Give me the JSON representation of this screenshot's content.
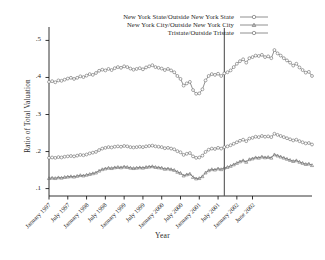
{
  "figure": {
    "background": "#ffffff",
    "ink": "#1d1d1d",
    "marker_color": "#6b6b6b"
  },
  "chart_data": {
    "type": "line",
    "title": "",
    "xlabel": "Year",
    "ylabel": "Ratio of Total Valuation",
    "ylim": [
      0.08,
      0.52
    ],
    "yticks": [
      0.1,
      0.2,
      0.3,
      0.4,
      0.5
    ],
    "ytick_labels": [
      ".1",
      ".2",
      ".3",
      ".4",
      ".5"
    ],
    "grid": false,
    "legend_position": "top-center",
    "xtick_labels": [
      "January 1997",
      "July 1997",
      "January 1998",
      "July 1998",
      "January 1999",
      "July 1999",
      "January 2000",
      "July 2000",
      "January 2001",
      "July 2001",
      "January 2002",
      "June 2002"
    ],
    "xtick_indices": [
      0,
      6,
      12,
      18,
      24,
      30,
      36,
      42,
      48,
      54,
      60,
      65
    ],
    "x_count": 66,
    "annotations": [
      {
        "name": "september-2001-reference-line",
        "x_index": 56,
        "label": ""
      }
    ],
    "series": [
      {
        "name": "New York State/Outside New York State",
        "marker": "circle",
        "values": [
          0.388,
          0.39,
          0.387,
          0.392,
          0.391,
          0.394,
          0.397,
          0.399,
          0.396,
          0.399,
          0.403,
          0.401,
          0.405,
          0.409,
          0.407,
          0.412,
          0.418,
          0.421,
          0.419,
          0.423,
          0.42,
          0.425,
          0.428,
          0.426,
          0.43,
          0.428,
          0.424,
          0.421,
          0.423,
          0.425,
          0.422,
          0.427,
          0.43,
          0.433,
          0.428,
          0.426,
          0.424,
          0.42,
          0.423,
          0.419,
          0.414,
          0.404,
          0.396,
          0.378,
          0.384,
          0.388,
          0.366,
          0.356,
          0.357,
          0.368,
          0.392,
          0.404,
          0.409,
          0.407,
          0.41,
          0.404,
          0.411,
          0.414,
          0.419,
          0.428,
          0.437,
          0.444,
          0.449,
          0.44,
          0.452,
          0.455,
          0.459,
          0.458,
          0.461,
          0.455,
          0.457,
          0.452,
          0.474,
          0.465,
          0.459,
          0.452,
          0.446,
          0.44,
          0.432,
          0.437,
          0.427,
          0.42,
          0.413,
          0.415,
          0.404
        ]
      },
      {
        "name": "Tristate/Outside Tristate",
        "marker": "circle",
        "values": [
          0.183,
          0.184,
          0.183,
          0.185,
          0.184,
          0.186,
          0.187,
          0.188,
          0.187,
          0.189,
          0.191,
          0.19,
          0.192,
          0.195,
          0.197,
          0.199,
          0.204,
          0.208,
          0.21,
          0.212,
          0.211,
          0.213,
          0.214,
          0.213,
          0.215,
          0.214,
          0.212,
          0.211,
          0.212,
          0.213,
          0.212,
          0.214,
          0.215,
          0.216,
          0.214,
          0.213,
          0.212,
          0.209,
          0.21,
          0.208,
          0.206,
          0.201,
          0.198,
          0.191,
          0.194,
          0.196,
          0.187,
          0.183,
          0.184,
          0.189,
          0.199,
          0.205,
          0.208,
          0.207,
          0.21,
          0.208,
          0.212,
          0.214,
          0.217,
          0.221,
          0.225,
          0.229,
          0.232,
          0.228,
          0.235,
          0.237,
          0.24,
          0.239,
          0.242,
          0.24,
          0.241,
          0.239,
          0.248,
          0.245,
          0.242,
          0.239,
          0.236,
          0.233,
          0.23,
          0.232,
          0.228,
          0.225,
          0.222,
          0.223,
          0.219
        ]
      },
      {
        "name": "New York City/Outside New York City",
        "marker": "triangle",
        "values": [
          0.128,
          0.129,
          0.128,
          0.13,
          0.129,
          0.131,
          0.132,
          0.133,
          0.132,
          0.134,
          0.136,
          0.135,
          0.137,
          0.139,
          0.141,
          0.143,
          0.148,
          0.152,
          0.154,
          0.156,
          0.155,
          0.157,
          0.158,
          0.157,
          0.159,
          0.158,
          0.156,
          0.155,
          0.156,
          0.157,
          0.156,
          0.158,
          0.159,
          0.16,
          0.158,
          0.157,
          0.156,
          0.153,
          0.154,
          0.152,
          0.15,
          0.145,
          0.142,
          0.135,
          0.138,
          0.14,
          0.131,
          0.127,
          0.128,
          0.133,
          0.143,
          0.149,
          0.152,
          0.151,
          0.154,
          0.152,
          0.156,
          0.158,
          0.161,
          0.165,
          0.169,
          0.173,
          0.176,
          0.172,
          0.179,
          0.181,
          0.184,
          0.183,
          0.186,
          0.184,
          0.185,
          0.183,
          0.192,
          0.189,
          0.186,
          0.183,
          0.18,
          0.177,
          0.174,
          0.176,
          0.172,
          0.169,
          0.166,
          0.167,
          0.163
        ]
      }
    ]
  },
  "legend": {
    "items": [
      {
        "label": "New York State/Outside New York State",
        "marker": "circle"
      },
      {
        "label": "New York City/Outside New York City",
        "marker": "triangle"
      },
      {
        "label": "Tristate/Outside Tristate",
        "marker": "circle"
      }
    ]
  }
}
